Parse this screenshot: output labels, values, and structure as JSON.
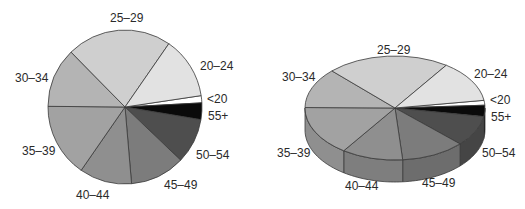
{
  "chart_data": [
    {
      "type": "pie",
      "title": "",
      "style": "2d",
      "categories": [
        "<20",
        "20-24",
        "25-29",
        "30-34",
        "35-39",
        "40-44",
        "45-49",
        "50-54",
        "55+"
      ],
      "labels": [
        "<20",
        "20–24",
        "25–29",
        "30–34",
        "35–39",
        "40–44",
        "45–49",
        "50–54",
        "55+"
      ],
      "values": [
        1.5,
        13,
        22,
        12.5,
        15.5,
        11,
        11.5,
        9.5,
        3.5
      ],
      "colors": [
        "#ffffff",
        "#e2e2e2",
        "#cfcfcf",
        "#b4b4b4",
        "#a2a2a2",
        "#8f8f8f",
        "#7c7c7c",
        "#4e4e4e",
        "#0a0a0a"
      ]
    },
    {
      "type": "pie",
      "title": "",
      "style": "3d",
      "categories": [
        "<20",
        "20-24",
        "25-29",
        "30-34",
        "35-39",
        "40-44",
        "45-49",
        "50-54",
        "55+"
      ],
      "labels": [
        "<20",
        "20–24",
        "25–29",
        "30–34",
        "35–39",
        "40–44",
        "45–49",
        "50–54",
        "55+"
      ],
      "values": [
        1.5,
        13,
        22,
        12.5,
        15.5,
        11,
        11.5,
        9.5,
        3.5
      ],
      "colors": [
        "#ffffff",
        "#e2e2e2",
        "#cfcfcf",
        "#b4b4b4",
        "#a2a2a2",
        "#8f8f8f",
        "#7c7c7c",
        "#4e4e4e",
        "#0a0a0a"
      ]
    }
  ],
  "labels_left": {
    "l25": "25–29",
    "l20": "20–24",
    "lu20": "<20",
    "l55": "55+",
    "l50": "50–54",
    "l45": "45–49",
    "l40": "40–44",
    "l35": "35–39",
    "l30": "30–34"
  },
  "labels_right": {
    "l25": "25–29",
    "l20": "20–24",
    "lu20": "<20",
    "l55": "55+",
    "l50": "50–54",
    "l45": "45–49",
    "l40": "40–44",
    "l35": "35–39",
    "l30": "30–34"
  }
}
